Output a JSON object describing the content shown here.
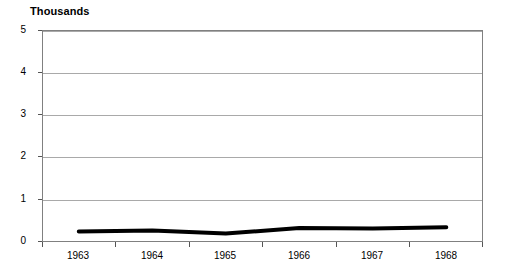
{
  "chart_data": {
    "type": "line",
    "title": "",
    "units_label": "Thousands",
    "xlabel": "",
    "ylabel": "",
    "categories": [
      "1963",
      "1964",
      "1965",
      "1966",
      "1967",
      "1968"
    ],
    "series": [
      {
        "name": "series-1",
        "values": [
          0.25,
          0.27,
          0.2,
          0.33,
          0.32,
          0.35
        ],
        "color": "#000000",
        "line_width": 4
      }
    ],
    "ylim": [
      0,
      5
    ],
    "yticks": [
      0,
      1,
      2,
      3,
      4,
      5
    ],
    "ytick_labels": [
      "0",
      "1",
      "2",
      "3",
      "4",
      "5"
    ],
    "grid": true,
    "grid_axis": "y",
    "legend": "none",
    "frame": true
  }
}
